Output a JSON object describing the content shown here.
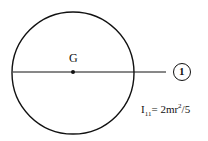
{
  "diagram": {
    "center_label": "G",
    "axis_label": "1",
    "formula": {
      "prefix": "I",
      "subscript": "11",
      "equals": "= 2mr",
      "superscript": "2",
      "suffix": "/5"
    }
  }
}
